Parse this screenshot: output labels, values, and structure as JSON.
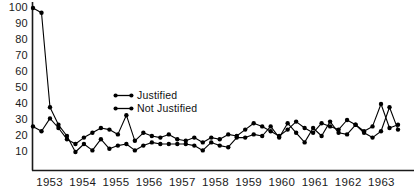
{
  "chart_data": {
    "type": "line",
    "title": "",
    "xlabel": "",
    "ylabel": "",
    "ylim": [
      0,
      100
    ],
    "yticks": [
      10,
      20,
      30,
      40,
      50,
      60,
      70,
      80,
      90,
      100
    ],
    "xticks": [
      "1953",
      "1954",
      "1955",
      "1956",
      "1957",
      "1958",
      "1959",
      "1960",
      "1961",
      "1962",
      "1963"
    ],
    "grid": false,
    "legend_position": "inside-upper-center",
    "x_frequency": "quarterly",
    "series": [
      {
        "name": "Justified",
        "marker": "filled-circle",
        "color": "#000000",
        "values": [
          26,
          23,
          31,
          25,
          18,
          15,
          19,
          22,
          25,
          24,
          21,
          33,
          17,
          22,
          20,
          19,
          21,
          18,
          17,
          19,
          16,
          19,
          18,
          21,
          20,
          24,
          28,
          26,
          23,
          20,
          24,
          29,
          25,
          22,
          28,
          26,
          24,
          30,
          27,
          23,
          26,
          40,
          25,
          27
        ]
      },
      {
        "name": "Not Justified",
        "marker": "filled-circle",
        "color": "#000000",
        "values": [
          100,
          97,
          38,
          27,
          20,
          10,
          15,
          11,
          18,
          12,
          14,
          15,
          11,
          14,
          16,
          15,
          15,
          15,
          15,
          14,
          11,
          16,
          14,
          13,
          19,
          19,
          21,
          20,
          26,
          19,
          28,
          22,
          16,
          25,
          20,
          29,
          22,
          21,
          27,
          22,
          19,
          23,
          38,
          24
        ]
      }
    ]
  },
  "legend": {
    "items": [
      {
        "label": "Justified"
      },
      {
        "label": "Not Justified"
      }
    ]
  }
}
